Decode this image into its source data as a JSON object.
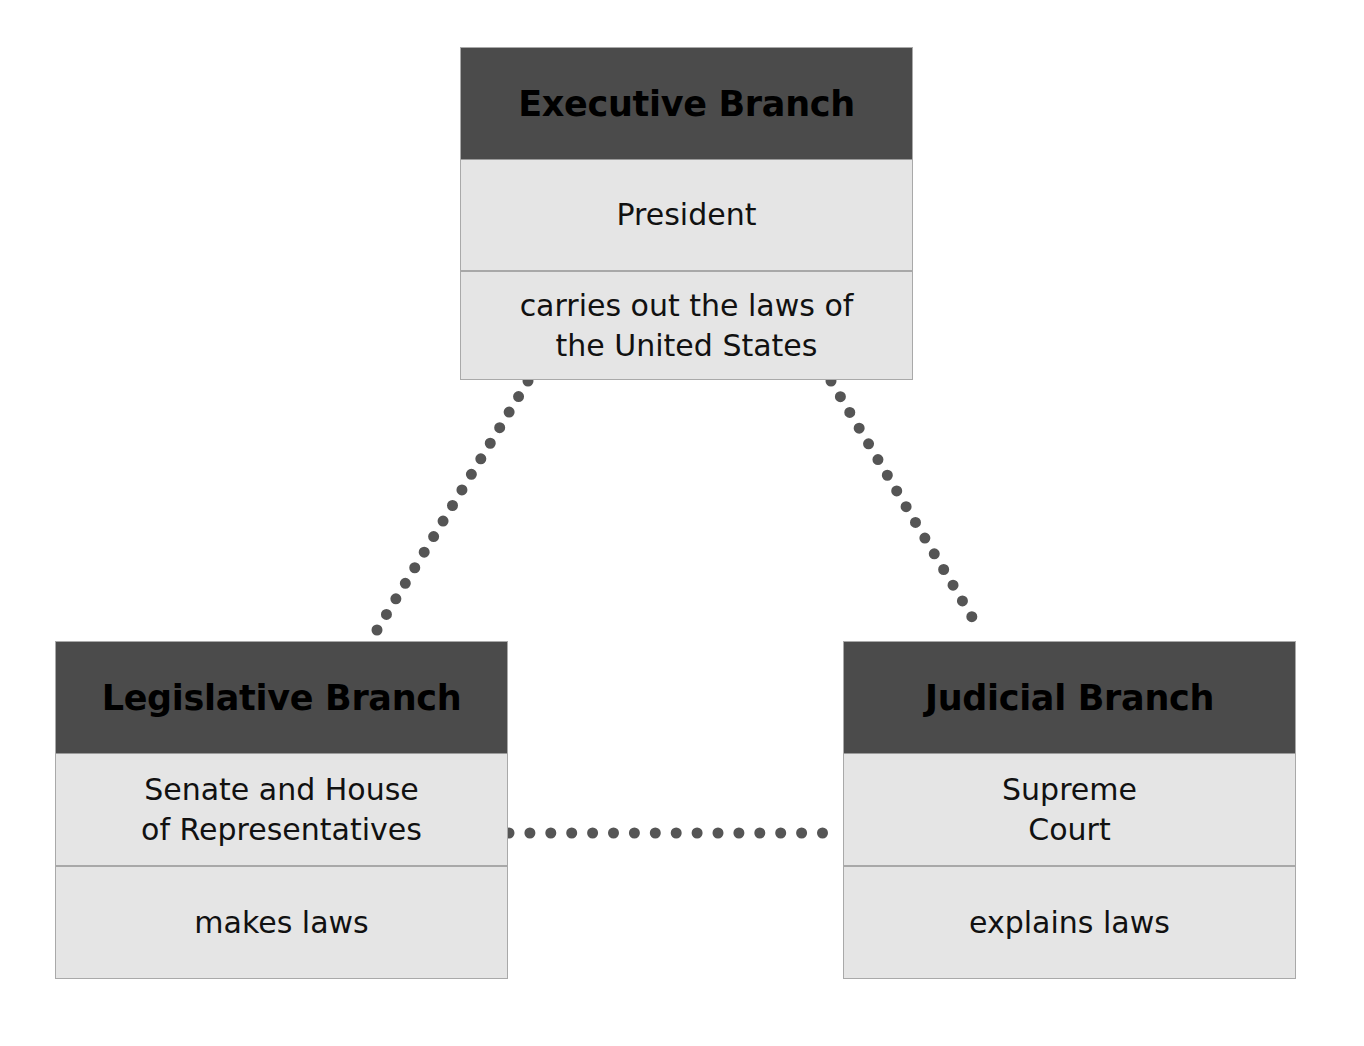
{
  "diagram": {
    "type": "three-branches-of-government",
    "colors": {
      "header_bg": "#4b4b4b",
      "body_bg": "#e5e5e5",
      "border": "#a9a9a9",
      "connector_dot": "#555555",
      "text": "#000000"
    },
    "branches": {
      "executive": {
        "title": "Executive Branch",
        "who": "President",
        "role": "carries out the laws of\nthe United States"
      },
      "legislative": {
        "title": "Legislative Branch",
        "who": "Senate and House\nof Representatives",
        "role": "makes laws"
      },
      "judicial": {
        "title": "Judicial Branch",
        "who": "Supreme\nCourt",
        "role": "explains laws"
      }
    },
    "connectors": [
      {
        "from": "executive",
        "to": "legislative",
        "style": "dotted",
        "x1": 528,
        "y1": 381,
        "x2": 377,
        "y2": 630
      },
      {
        "from": "executive",
        "to": "judicial",
        "style": "dotted",
        "x1": 831,
        "y1": 381,
        "x2": 981,
        "y2": 632
      },
      {
        "from": "legislative",
        "to": "judicial",
        "style": "dotted",
        "x1": 509,
        "y1": 833,
        "x2": 843,
        "y2": 833
      }
    ]
  }
}
